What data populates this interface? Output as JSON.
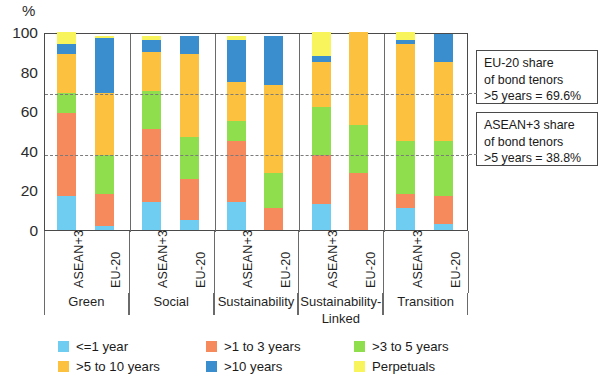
{
  "axis": {
    "unit": "%",
    "yticks": [
      0,
      20,
      40,
      60,
      80,
      100
    ],
    "ymin": 0,
    "ymax": 100
  },
  "annotations": [
    {
      "line1": "EU-20 share",
      "line2": "of bond tenors",
      "line3": ">5 years = 69.6%",
      "value": 69.6
    },
    {
      "line1": "ASEAN+3 share",
      "line2": "of bond tenors",
      "line3": ">5 years = 38.8%",
      "value": 38.8
    }
  ],
  "legend": [
    {
      "label": "<=1 year",
      "color": "#6ecdf0"
    },
    {
      "label": ">1 to 3 years",
      "color": "#f68a5c"
    },
    {
      "label": ">3 to 5 years",
      "color": "#8ede4d"
    },
    {
      "label": ">5 to 10 years",
      "color": "#fcc13f"
    },
    {
      "label": ">10 years",
      "color": "#3a8ecd"
    },
    {
      "label": "Perpetuals",
      "color": "#f7f45c"
    }
  ],
  "chart_data": {
    "type": "bar",
    "subtype": "stacked-column-100",
    "title": "",
    "xlabel": "",
    "ylabel": "%",
    "ylim": [
      0,
      100
    ],
    "grid": false,
    "legend_position": "bottom",
    "groups": [
      "Green",
      "Social",
      "Sustainability",
      "Sustainability-Linked",
      "Transition"
    ],
    "group_label_lines": [
      [
        "Green"
      ],
      [
        "Social"
      ],
      [
        "Sustainability"
      ],
      [
        "Sustainability-",
        "Linked"
      ],
      [
        "Transition"
      ]
    ],
    "categories": [
      "Green ASEAN+3",
      "Green EU-20",
      "Social ASEAN+3",
      "Social EU-20",
      "Sustainability ASEAN+3",
      "Sustainability EU-20",
      "Sustainability-Linked ASEAN+3",
      "Sustainability-Linked EU-20",
      "Transition ASEAN+3",
      "Transition EU-20"
    ],
    "region_labels": [
      "ASEAN+3",
      "EU-20",
      "ASEAN+3",
      "EU-20",
      "ASEAN+3",
      "EU-20",
      "ASEAN+3",
      "EU-20",
      "ASEAN+3",
      "EU-20"
    ],
    "series": [
      {
        "name": "<=1 year",
        "color": "#6ecdf0",
        "values": [
          17.0,
          2.0,
          14.0,
          5.0,
          14.0,
          0.0,
          13.0,
          0.0,
          11.0,
          3.0
        ]
      },
      {
        "name": ">1 to 3 years",
        "color": "#f68a5c",
        "values": [
          42.0,
          16.0,
          37.0,
          21.0,
          31.0,
          11.0,
          25.0,
          29.0,
          7.0,
          14.0
        ]
      },
      {
        "name": ">3 to 5 years",
        "color": "#8ede4d",
        "values": [
          10.0,
          20.0,
          19.0,
          21.0,
          10.0,
          18.0,
          24.0,
          24.0,
          27.0,
          28.0
        ]
      },
      {
        "name": ">5 to 10 years",
        "color": "#fcc13f",
        "values": [
          20.0,
          31.0,
          20.0,
          42.0,
          20.0,
          44.0,
          23.0,
          47.0,
          49.0,
          40.0
        ]
      },
      {
        "name": ">10 years",
        "color": "#3a8ecd",
        "values": [
          5.0,
          28.0,
          6.0,
          9.0,
          21.0,
          25.0,
          3.0,
          0.0,
          2.0,
          14.0
        ]
      },
      {
        "name": "Perpetuals",
        "color": "#f7f45c",
        "values": [
          6.0,
          1.0,
          2.0,
          0.0,
          2.0,
          0.0,
          12.0,
          0.0,
          4.0,
          0.0
        ]
      }
    ],
    "reference_lines": [
      {
        "label": "EU-20 share of bond tenors >5 years",
        "value": 69.6
      },
      {
        "label": "ASEAN+3 share of bond tenors >5 years",
        "value": 38.8
      }
    ]
  }
}
